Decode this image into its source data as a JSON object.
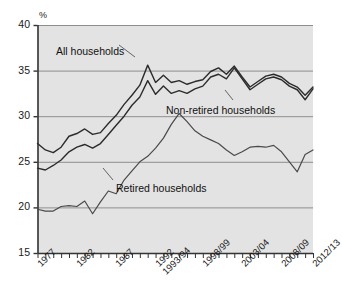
{
  "chart_data": {
    "type": "line",
    "title": "",
    "xlabel": "",
    "ylabel": "%",
    "ylim": [
      15,
      40
    ],
    "yticks": [
      15,
      20,
      25,
      30,
      35,
      40
    ],
    "grid": "horizontal",
    "legend_position": "inline-annotations",
    "xtick_labels": [
      "1977",
      "1982",
      "1987",
      "1992",
      "1993/94",
      "1998/99",
      "2003/04",
      "2008/09",
      "2012/13"
    ],
    "xtick_index": [
      0,
      5,
      10,
      15,
      16,
      21,
      26,
      31,
      35
    ],
    "x": [
      "1977",
      "1978",
      "1979",
      "1980",
      "1981",
      "1982",
      "1983",
      "1984",
      "1985",
      "1986",
      "1987",
      "1988",
      "1989",
      "1990",
      "1991",
      "1992",
      "1993/94",
      "1994/95",
      "1995/96",
      "1996/97",
      "1997/98",
      "1998/99",
      "1999/00",
      "2000/01",
      "2001/02",
      "2002/03",
      "2003/04",
      "2004/05",
      "2005/06",
      "2006/07",
      "2007/08",
      "2008/09",
      "2009/10",
      "2010/11",
      "2011/12",
      "2012/13"
    ],
    "series": [
      {
        "name": "All households",
        "color": "#2b2b2b",
        "values": [
          27.0,
          26.3,
          26.0,
          26.6,
          27.8,
          28.1,
          28.6,
          28.0,
          28.2,
          29.2,
          30.1,
          31.3,
          32.3,
          33.4,
          35.6,
          33.7,
          34.5,
          33.7,
          33.9,
          33.5,
          33.8,
          34.0,
          34.9,
          35.3,
          34.6,
          35.5,
          34.3,
          33.2,
          33.8,
          34.4,
          34.6,
          34.3,
          33.6,
          33.2,
          32.3,
          33.2
        ],
        "linewidth": 1.4
      },
      {
        "name": "Non-retired households",
        "color": "#2b2b2b",
        "values": [
          24.3,
          24.1,
          24.6,
          25.2,
          26.1,
          26.6,
          26.9,
          26.5,
          27.0,
          28.0,
          29.0,
          30.0,
          31.2,
          32.1,
          33.9,
          32.4,
          33.3,
          32.5,
          32.8,
          32.5,
          33.0,
          33.3,
          34.3,
          34.6,
          34.1,
          35.3,
          34.1,
          32.9,
          33.5,
          34.1,
          34.3,
          34.0,
          33.3,
          32.9,
          31.8,
          33.0
        ],
        "linewidth": 1.4
      },
      {
        "name": "Retired households",
        "color": "#4a4a4a",
        "values": [
          19.8,
          19.6,
          19.6,
          20.1,
          20.2,
          20.1,
          20.7,
          19.3,
          20.6,
          21.8,
          21.5,
          23.0,
          24.0,
          25.0,
          25.6,
          26.5,
          27.6,
          29.1,
          30.3,
          29.4,
          28.4,
          27.8,
          27.4,
          27.0,
          26.3,
          25.7,
          26.1,
          26.6,
          26.7,
          26.6,
          26.8,
          26.1,
          25.0,
          23.9,
          25.8,
          26.3
        ],
        "linewidth": 1.2
      }
    ],
    "annotations": [
      {
        "text": "All households",
        "x_px": 56,
        "y_px": 45
      },
      {
        "text": "Non-retired households",
        "x_px": 166,
        "y_px": 104
      },
      {
        "text": "Retired households",
        "x_px": 116,
        "y_px": 182
      }
    ]
  }
}
